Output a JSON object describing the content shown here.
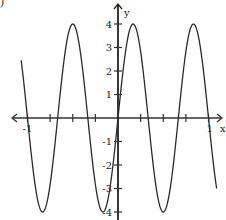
{
  "figure": {
    "corner_label": ")"
  },
  "chart_data": {
    "type": "line",
    "title": "",
    "xlabel": "x",
    "ylabel": "y",
    "xlim": [
      -1.1,
      1.15
    ],
    "ylim": [
      -4.2,
      4.5
    ],
    "x_ticks": [
      -1,
      -0.75,
      -0.5,
      -0.25,
      0,
      0.25,
      0.5,
      0.75,
      1
    ],
    "x_tick_labels": [
      {
        "value": -1,
        "label": "-1"
      },
      {
        "value": 1,
        "label": "1"
      }
    ],
    "y_ticks": [
      -4,
      -3,
      -2,
      -1,
      1,
      2,
      3,
      4
    ],
    "y_tick_labels": [
      {
        "value": 4,
        "label": "4"
      },
      {
        "value": 3,
        "label": "3"
      },
      {
        "value": 2,
        "label": "2"
      },
      {
        "value": 1,
        "label": "1"
      },
      {
        "value": -1,
        "label": "-1"
      },
      {
        "value": -2,
        "label": "-2"
      },
      {
        "value": -3,
        "label": "-3"
      },
      {
        "value": -4,
        "label": "-4"
      }
    ],
    "grid": false,
    "series": [
      {
        "name": "y = 4 sin(3πx)",
        "function": "4*sin(3*pi*x)",
        "amplitude": 4,
        "period": 0.6667,
        "x_range": [
          -1.07,
          1.09
        ],
        "key_points": [
          {
            "x": -0.833,
            "y": -4
          },
          {
            "x": -0.5,
            "y": 4
          },
          {
            "x": -0.167,
            "y": -4
          },
          {
            "x": 0,
            "y": 0
          },
          {
            "x": 0.167,
            "y": 4
          },
          {
            "x": 0.5,
            "y": -4
          },
          {
            "x": 0.833,
            "y": 4
          }
        ]
      }
    ]
  }
}
